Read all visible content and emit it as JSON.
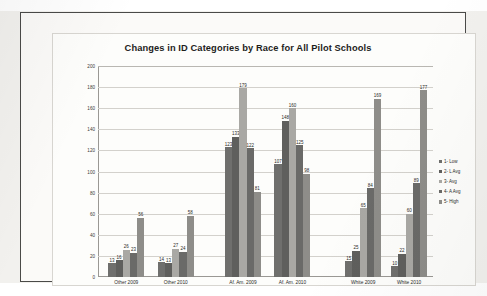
{
  "chart_data": {
    "type": "bar",
    "title": "Changes in ID Categories by Race for All Pilot Schools",
    "xlabel": "",
    "ylabel": "",
    "ylim": [
      0,
      200
    ],
    "yticks": [
      0,
      20,
      40,
      60,
      80,
      100,
      120,
      140,
      160,
      180,
      200
    ],
    "grid": true,
    "legend_position": "right",
    "categories": [
      "Other 2009",
      "Other 2010",
      "Af. Am. 2009",
      "Af. Am. 2010",
      "White 2009",
      "White 2010"
    ],
    "series": [
      {
        "name": "1- Low",
        "color": "#6f6f6d",
        "values": [
          13,
          14,
          123,
          107,
          15,
          10
        ]
      },
      {
        "name": "2- L Avg",
        "color": "#5f5f5d",
        "values": [
          16,
          13,
          133,
          148,
          25,
          22
        ]
      },
      {
        "name": "3- Avg",
        "color": "#a9a8a4",
        "values": [
          26,
          27,
          179,
          160,
          65,
          60
        ]
      },
      {
        "name": "4- A Avg",
        "color": "#6a6a68",
        "values": [
          23,
          24,
          122,
          125,
          84,
          89
        ]
      },
      {
        "name": "5- High",
        "color": "#8e8d89",
        "values": [
          56,
          58,
          81,
          98,
          169,
          177
        ]
      }
    ]
  },
  "legend": {
    "items": [
      "1- Low",
      "2- L Avg",
      "3- Avg",
      "4- A Avg",
      "5- High"
    ]
  }
}
